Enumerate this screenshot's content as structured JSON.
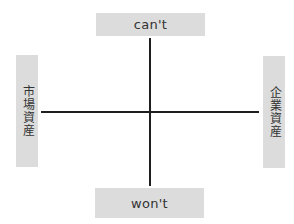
{
  "diagram": {
    "type": "quadrant-matrix",
    "axes": {
      "vertical": {
        "top_label": "can't",
        "bottom_label": "won't"
      },
      "horizontal": {
        "left_label": "市場資産",
        "right_label": "企業資産"
      }
    },
    "colors": {
      "label_box_background": "#dcdcdc",
      "label_text": "#333333",
      "axis_line": "#1e1e1e",
      "background": "#ffffff"
    }
  }
}
